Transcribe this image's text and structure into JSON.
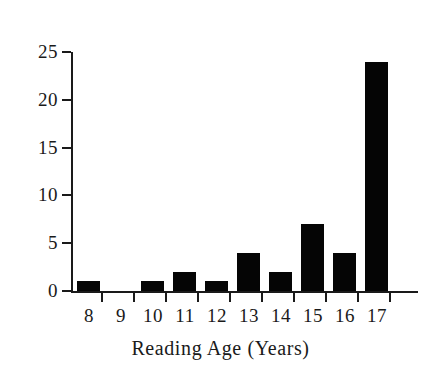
{
  "chart_data": {
    "type": "bar",
    "title": "",
    "xlabel": "Reading Age (Years)",
    "ylabel": "",
    "categories": [
      "8",
      "9",
      "10",
      "11",
      "12",
      "13",
      "14",
      "15",
      "16",
      "17"
    ],
    "values": [
      1,
      0,
      1,
      2,
      1,
      4,
      2,
      7,
      4,
      24
    ],
    "xlim": [
      "8",
      "17"
    ],
    "ylim": [
      0,
      25
    ],
    "yticks": [
      0,
      5,
      10,
      15,
      20,
      25
    ],
    "ytick_labels": [
      "0",
      "5",
      "10",
      "15",
      "20",
      "25"
    ],
    "xticks": [
      "8",
      "9",
      "10",
      "11",
      "12",
      "13",
      "14",
      "15",
      "16",
      "17"
    ],
    "grid": false,
    "legend": false,
    "bar_color": "#050505",
    "axis_color": "#1a1a1a",
    "background_color": "#ffffff"
  }
}
